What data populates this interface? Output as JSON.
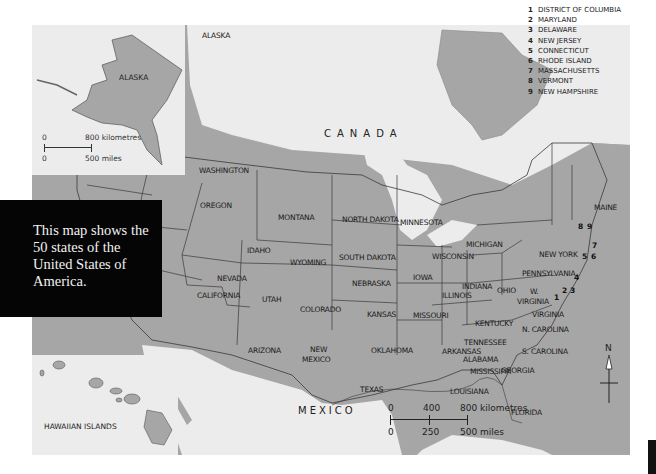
{
  "caption": {
    "text": "This map shows the 50 states of the United States of America."
  },
  "map": {
    "colors": {
      "land_us": "#a6a6a6",
      "land_other": "#a6a6a6",
      "water": "#ececec",
      "border": "#3a3a3a",
      "caption_bg": "#050505"
    },
    "countries": {
      "canada": "CANADA",
      "mexico": "MEXICO",
      "alaska_main": "ALASKA"
    },
    "states": {
      "washington": "WASHINGTON",
      "oregon": "OREGON",
      "california": "CALIFORNIA",
      "idaho": "IDAHO",
      "nevada": "NEVADA",
      "montana": "MONTANA",
      "wyoming": "WYOMING",
      "utah": "UTAH",
      "arizona": "ARIZONA",
      "colorado": "COLORADO",
      "new_mexico_1": "NEW",
      "new_mexico_2": "MEXICO",
      "north_dakota": "NORTH DAKOTA",
      "south_dakota": "SOUTH DAKOTA",
      "nebraska": "NEBRASKA",
      "kansas": "KANSAS",
      "oklahoma": "OKLAHOMA",
      "texas": "TEXAS",
      "minnesota": "MINNESOTA",
      "iowa": "IOWA",
      "missouri": "MISSOURI",
      "arkansas": "ARKANSAS",
      "louisiana": "LOUISIANA",
      "wisconsin": "WISCONSIN",
      "illinois": "ILLINOIS",
      "michigan": "MICHIGAN",
      "indiana": "INDIANA",
      "ohio": "OHIO",
      "kentucky": "KENTUCKY",
      "tennessee": "TENNESSEE",
      "mississippi": "MISSISSIPPI",
      "alabama": "ALABAMA",
      "georgia": "GEORGIA",
      "florida": "FLORIDA",
      "south_carolina": "S. CAROLINA",
      "north_carolina": "N. CAROLINA",
      "virginia": "VIRGINIA",
      "west_virginia_1": "W.",
      "west_virginia_2": "VIRGINIA",
      "pennsylvania": "PENNSYLVANIA",
      "new_york": "NEW YORK",
      "maine": "MAINE"
    },
    "numbered_markers": [
      "1",
      "2",
      "3",
      "4",
      "5",
      "6",
      "7",
      "8",
      "9"
    ],
    "legend": [
      {
        "num": "1",
        "name": "DISTRICT OF COLUMBIA"
      },
      {
        "num": "2",
        "name": "MARYLAND"
      },
      {
        "num": "3",
        "name": "DELAWARE"
      },
      {
        "num": "4",
        "name": "NEW JERSEY"
      },
      {
        "num": "5",
        "name": "CONNECTICUT"
      },
      {
        "num": "6",
        "name": "RHODE ISLAND"
      },
      {
        "num": "7",
        "name": "MASSACHUSETTS"
      },
      {
        "num": "8",
        "name": "VERMONT"
      },
      {
        "num": "9",
        "name": "NEW HAMPSHIRE"
      }
    ],
    "insets": {
      "alaska": {
        "label": "ALASKA",
        "scale": {
          "km_start": "0",
          "km_end": "800 kilometres",
          "mi_start": "0",
          "mi_end": "500 miles"
        }
      },
      "hawaii": {
        "label": "HAWAIIAN ISLANDS"
      }
    },
    "scale_bar": {
      "km": [
        "0",
        "400",
        "800 kilometres"
      ],
      "mi": [
        "0",
        "250",
        "500 miles"
      ]
    },
    "compass": {
      "label": "N"
    }
  }
}
